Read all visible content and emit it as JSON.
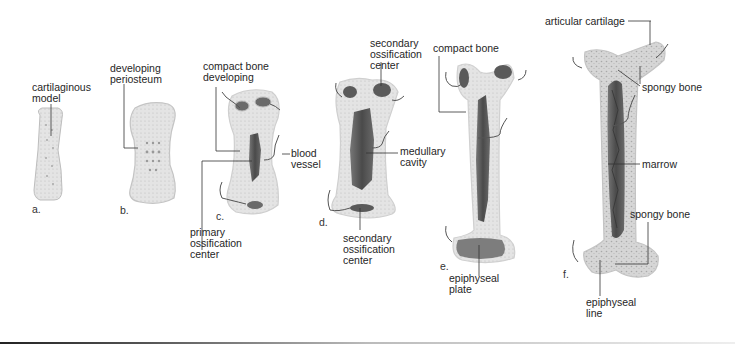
{
  "diagram": {
    "stages": [
      {
        "letter": "a.",
        "labels": [
          "cartilaginous\nmodel"
        ]
      },
      {
        "letter": "b.",
        "labels": [
          "developing\nperiosteum"
        ]
      },
      {
        "letter": "c.",
        "labels": [
          "compact bone\ndeveloping",
          "blood\nvessel",
          "primary\nossification\ncenter"
        ]
      },
      {
        "letter": "d.",
        "labels": [
          "secondary\nossification\ncenter",
          "medullary\ncavity",
          "secondary\nossification\ncenter"
        ]
      },
      {
        "letter": "e.",
        "labels": [
          "compact bone",
          "epiphyseal\nplate"
        ]
      },
      {
        "letter": "f.",
        "labels": [
          "articular cartilage",
          "spongy bone",
          "marrow",
          "spongy bone",
          "epiphyseal\nline"
        ]
      }
    ],
    "colors": {
      "bone_light": "#e6e6e6",
      "bone_mid": "#c8c8c8",
      "cavity_dark": "#5a5a5a",
      "leader_line": "#333333",
      "vessel": "#555555"
    }
  }
}
